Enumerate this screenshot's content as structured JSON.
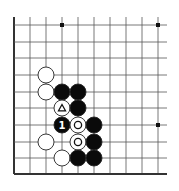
{
  "board": {
    "columns_x": [
      14,
      30,
      46,
      62,
      78,
      94,
      110,
      126,
      142,
      158
    ],
    "rows_y": [
      25,
      42,
      58,
      75,
      92,
      108,
      125,
      142,
      158,
      174
    ],
    "right_extent": 167,
    "top_extent": 17,
    "left_edge_thick": true,
    "bottom_edge_thick": true,
    "stone_radius": 8,
    "line_color": "#555555",
    "edge_color": "#333333",
    "star_points": [
      {
        "col": 3,
        "row": 0
      },
      {
        "col": 9,
        "row": 0
      },
      {
        "col": 9,
        "row": 6
      }
    ],
    "stones": [
      {
        "color": "white",
        "col": 2,
        "row": 3,
        "mark": ""
      },
      {
        "color": "white",
        "col": 2,
        "row": 4,
        "mark": ""
      },
      {
        "color": "black",
        "col": 3,
        "row": 4,
        "mark": ""
      },
      {
        "color": "black",
        "col": 4,
        "row": 4,
        "mark": ""
      },
      {
        "color": "white",
        "col": 3,
        "row": 5,
        "mark": "triangle"
      },
      {
        "color": "black",
        "col": 4,
        "row": 5,
        "mark": ""
      },
      {
        "color": "black",
        "col": 3,
        "row": 6,
        "mark": "1"
      },
      {
        "color": "white",
        "col": 4,
        "row": 6,
        "mark": "circle"
      },
      {
        "color": "black",
        "col": 5,
        "row": 6,
        "mark": ""
      },
      {
        "color": "white",
        "col": 2,
        "row": 7,
        "mark": ""
      },
      {
        "color": "white",
        "col": 4,
        "row": 7,
        "mark": "circle"
      },
      {
        "color": "black",
        "col": 5,
        "row": 7,
        "mark": ""
      },
      {
        "color": "white",
        "col": 3,
        "row": 8,
        "mark": ""
      },
      {
        "color": "black",
        "col": 4,
        "row": 8,
        "mark": ""
      },
      {
        "color": "black",
        "col": 5,
        "row": 8,
        "mark": ""
      }
    ]
  }
}
